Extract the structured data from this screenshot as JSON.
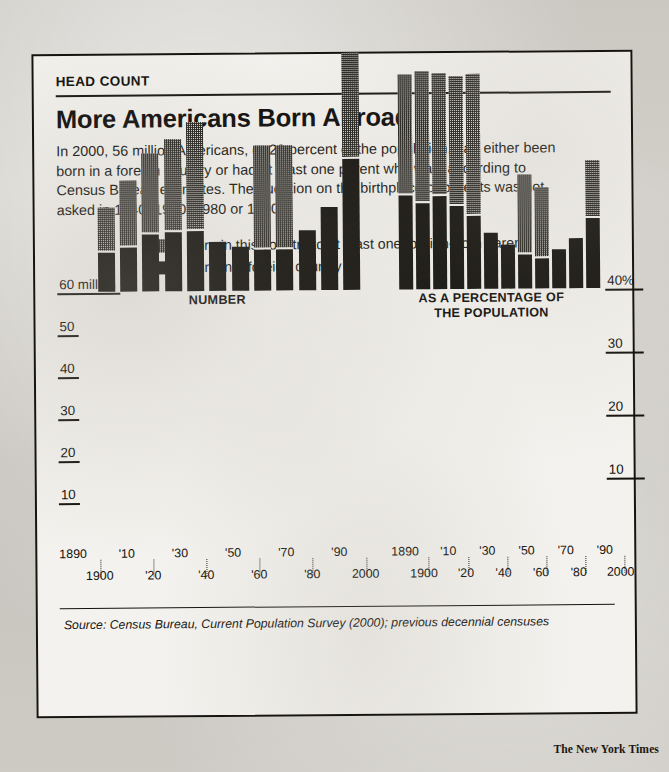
{
  "kicker": "HEAD COUNT",
  "headline": "More Americans Born Abroad",
  "deck": "In 2000, 56 million Americans, or 20 percent of the population, had either been born in a foreign country or had at least one parent who was, according to Census Bureau estimates. The question on the birthplace of parents was not asked in 1940, 1950, 1980 or 1990.",
  "legend": [
    {
      "label": "Born in this country to at least one foreign-born parent",
      "swatch": "hatched-gray"
    },
    {
      "label": "Born in a foreign country",
      "swatch": "solid-black"
    }
  ],
  "source": "Source: Census Bureau, Current Population Survey (2000); previous decennial censuses",
  "credit": "The New York Times",
  "colors": {
    "ink": "#100e0a",
    "paper": "#f4f2ee",
    "scan_background": "#c9c6c0",
    "hatch": "#1c1a15"
  },
  "xlabels_top": [
    "1890",
    "'10",
    "'30",
    "'50",
    "'70",
    "'90"
  ],
  "xlabels_bottom": [
    "1900",
    "'20",
    "'40",
    "'60",
    "'80",
    "2000"
  ],
  "chart_data": [
    {
      "id": "number",
      "type": "bar",
      "title": "NUMBER",
      "stacked": true,
      "xlabel": "",
      "ylabel": "",
      "ylim": [
        0,
        60
      ],
      "yticks": [
        10,
        20,
        30,
        40,
        50,
        60
      ],
      "ytick_labels": [
        "10",
        "20",
        "30",
        "40",
        "50",
        "60 million"
      ],
      "grid": false,
      "unit": "millions",
      "categories": [
        "1890",
        "1900",
        "'10",
        "'20",
        "'30",
        "'40",
        "'50",
        "'60",
        "'70",
        "'80",
        "'90",
        "2000"
      ],
      "series": [
        {
          "name": "Born in a foreign country",
          "style": "solid-black",
          "values": [
            9.2,
            10.3,
            13.5,
            13.9,
            14.2,
            11.6,
            10.3,
            9.7,
            9.6,
            14.1,
            19.8,
            31.1
          ]
        },
        {
          "name": "Born in this country to at least one foreign-born parent",
          "style": "hatched-gray",
          "values": [
            10.3,
            15.6,
            18.9,
            21.8,
            25.4,
            0,
            0,
            24.3,
            24.4,
            0,
            0,
            24.9
          ]
        }
      ],
      "totals": [
        19.5,
        25.9,
        32.4,
        35.7,
        39.6,
        11.6,
        10.3,
        34.0,
        34.0,
        14.1,
        19.8,
        56.0
      ],
      "note": "Parent-birthplace question not asked in 1940, 1950, 1980 or 1990, so those bars show only the foreign-born segment."
    },
    {
      "id": "percentage",
      "type": "bar",
      "title": "AS A PERCENTAGE OF THE POPULATION",
      "stacked": true,
      "xlabel": "",
      "ylabel": "",
      "ylim": [
        0,
        40
      ],
      "yticks": [
        10,
        20,
        30,
        40
      ],
      "ytick_labels": [
        "10",
        "20",
        "30",
        "40%"
      ],
      "grid": false,
      "unit": "percent",
      "categories": [
        "1890",
        "1900",
        "'10",
        "'20",
        "'30",
        "'40",
        "'50",
        "'60",
        "'70",
        "'80",
        "'90",
        "2000"
      ],
      "series": [
        {
          "name": "Born in a foreign country",
          "style": "solid-black",
          "values": [
            14.8,
            13.6,
            14.7,
            13.2,
            11.6,
            8.8,
            6.9,
            5.4,
            4.7,
            6.2,
            7.9,
            11.1
          ]
        },
        {
          "name": "Born in this country to at least one foreign-born parent",
          "style": "hatched-gray",
          "values": [
            18.9,
            20.6,
            19.3,
            20.3,
            22.1,
            0,
            0,
            12.3,
            11.0,
            0,
            0,
            8.9
          ]
        }
      ],
      "totals": [
        33.7,
        34.2,
        34.0,
        33.5,
        33.7,
        8.8,
        6.9,
        17.7,
        15.7,
        6.2,
        7.9,
        20.0
      ]
    }
  ]
}
